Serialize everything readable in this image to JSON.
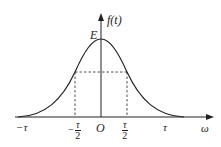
{
  "diagram": {
    "type": "bell-curve",
    "y_axis_label": "f(t)",
    "x_axis_label": "ω",
    "peak_label": "E",
    "origin_label": "O",
    "x_ticks": [
      {
        "label": "−τ"
      },
      {
        "sign": "−",
        "num": "τ",
        "den": "2"
      },
      {
        "num": "τ",
        "den": "2"
      },
      {
        "label": "τ"
      }
    ],
    "colors": {
      "line": "#222222",
      "background": "#ffffff"
    }
  }
}
